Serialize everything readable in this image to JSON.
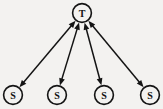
{
  "diagram": {
    "type": "node-link-graph",
    "canvas": {
      "width": 163,
      "height": 109,
      "background": "#f3f2f0"
    },
    "stroke_color": "#141414",
    "nodes": [
      {
        "id": "T",
        "label": "T",
        "role": "target",
        "shape": "circle",
        "cx": 82,
        "cy": 13,
        "r": 9.4
      },
      {
        "id": "S1",
        "label": "S",
        "role": "source",
        "shape": "circle",
        "cx": 13,
        "cy": 95,
        "r": 9.4
      },
      {
        "id": "S2",
        "label": "S",
        "role": "source",
        "shape": "circle",
        "cx": 57,
        "cy": 95,
        "r": 9.4
      },
      {
        "id": "S3",
        "label": "S",
        "role": "source",
        "shape": "circle",
        "cx": 104,
        "cy": 95,
        "r": 9.4
      },
      {
        "id": "S4",
        "label": "S",
        "role": "source",
        "shape": "circle",
        "cx": 150,
        "cy": 95,
        "r": 9.4
      }
    ],
    "edges": [
      {
        "id": "E1",
        "from": "S1",
        "to": "T",
        "direction": "bidirectional",
        "label": ""
      },
      {
        "id": "E2",
        "from": "S2",
        "to": "T",
        "direction": "bidirectional",
        "label": ""
      },
      {
        "id": "E3",
        "from": "S3",
        "to": "T",
        "direction": "bidirectional",
        "label": ""
      },
      {
        "id": "E4",
        "from": "S4",
        "to": "T",
        "direction": "bidirectional",
        "label": ""
      }
    ]
  }
}
